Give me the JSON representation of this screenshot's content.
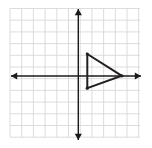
{
  "figure": {
    "title": "Coordinate plane with a right-pointing triangle",
    "canvas": {
      "width": 152,
      "height": 148
    },
    "background_color": "#ffffff"
  },
  "grid": {
    "label": "square grid",
    "line_color": "#d8d8d8",
    "line_width": 0.9,
    "cell_size_px": 11.7,
    "left_px": 10,
    "top_px": 8.5,
    "right_px": 140,
    "bottom_px": 137,
    "columns": 11,
    "rows": 11,
    "visible": true
  },
  "axes": {
    "color": "#1a1a1a",
    "line_width": 1.4,
    "arrowheads": true,
    "origin_px": {
      "x": 78.3,
      "y": 76.0
    },
    "x_axis": {
      "name": "x-axis",
      "y_px": 76.0,
      "start_px": 11,
      "end_px": 141,
      "left_arrow": true,
      "right_arrow": true,
      "tick_labels": []
    },
    "y_axis": {
      "name": "y-axis",
      "x_px": 78.3,
      "start_px": 9,
      "end_px": 140,
      "top_arrow": true,
      "bottom_arrow": true,
      "tick_labels": []
    }
  },
  "shape": {
    "name": "triangle",
    "type": "polygon",
    "stroke_color": "#231f20",
    "stroke_width": 2.0,
    "fill": "none",
    "vertex_marker": true,
    "vertex_marker_radius": 1.6,
    "vertices_px": [
      {
        "label": "top-left",
        "x": 87.3,
        "y": 54.0
      },
      {
        "label": "right-apex",
        "x": 121.8,
        "y": 75.8
      },
      {
        "label": "bottom-left",
        "x": 87.3,
        "y": 88.2
      }
    ],
    "vertices_grid": [
      {
        "label": "top-left",
        "x": 1,
        "y": 2
      },
      {
        "label": "right-apex",
        "x": 4,
        "y": 0
      },
      {
        "label": "bottom-left",
        "x": 1,
        "y": -1
      }
    ]
  },
  "chart_data": {
    "type": "scatter",
    "title": "",
    "xlabel": "",
    "ylabel": "",
    "grid": true,
    "legend": "none",
    "xlim": [
      -6,
      5
    ],
    "ylim": [
      -5,
      6
    ],
    "series": [
      {
        "name": "triangle",
        "closed": true,
        "x": [
          1,
          4,
          1
        ],
        "y": [
          2,
          0,
          -1
        ]
      }
    ]
  }
}
